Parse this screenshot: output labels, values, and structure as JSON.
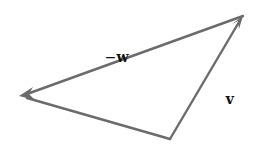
{
  "diagram": {
    "stroke_color": "#6b6b6b",
    "label_color": "#111111",
    "vertices": {
      "origin_bottom": [
        170,
        139
      ],
      "tip_top_right": [
        243,
        16
      ],
      "tip_left": [
        20,
        96
      ]
    },
    "vectors": [
      {
        "name": "v",
        "from": [
          170,
          139
        ],
        "to": [
          243,
          16
        ],
        "label": "v"
      },
      {
        "name": "-w",
        "from": [
          243,
          16
        ],
        "to": [
          20,
          96
        ],
        "label": "−w"
      },
      {
        "name": "v-w",
        "from": [
          170,
          139
        ],
        "to": [
          20,
          96
        ],
        "label": "v − w"
      }
    ],
    "labels": {
      "neg_w": {
        "minus": "−",
        "var": "w"
      },
      "v": "v",
      "v_minus_w": {
        "left": "v",
        "op": "−",
        "right": "w"
      }
    }
  }
}
